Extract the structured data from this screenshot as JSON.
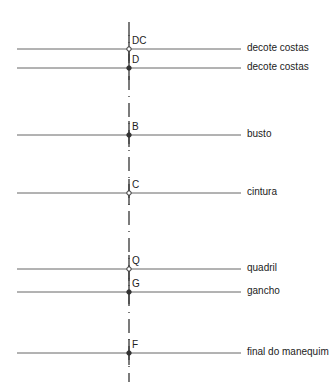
{
  "diagram": {
    "type": "pattern-measurement-guide",
    "axis": {
      "x": 129,
      "y_top": 22,
      "y_bottom": 382
    },
    "line": {
      "x_start": 17,
      "x_end": 241
    },
    "levels": [
      {
        "point": "DC",
        "label": "decote costas",
        "y": 49,
        "marker": "open"
      },
      {
        "point": "D",
        "label": "decote costas",
        "y": 68,
        "marker": "filled"
      },
      {
        "point": "B",
        "label": "busto",
        "y": 135,
        "marker": "filled"
      },
      {
        "point": "C",
        "label": "cintura",
        "y": 193,
        "marker": "open"
      },
      {
        "point": "Q",
        "label": "quadril",
        "y": 269,
        "marker": "open"
      },
      {
        "point": "G",
        "label": "gancho",
        "y": 292,
        "marker": "filled"
      },
      {
        "point": "F",
        "label": "final do manequim",
        "y": 353,
        "marker": "filled"
      }
    ],
    "colors": {
      "line": "#555555",
      "text": "#222222"
    }
  }
}
